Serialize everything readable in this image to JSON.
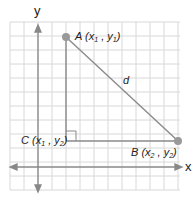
{
  "diagram": {
    "axes": {
      "x_label": "x",
      "y_label": "y"
    },
    "points": {
      "A": {
        "name": "A",
        "coord_x": "x",
        "coord_x_sub": "1",
        "coord_y": "y",
        "coord_y_sub": "1"
      },
      "B": {
        "name": "B",
        "coord_x": "x",
        "coord_x_sub": "2",
        "coord_y": "y",
        "coord_y_sub": "2"
      },
      "C": {
        "name": "C",
        "coord_x": "x",
        "coord_x_sub": "1",
        "coord_y": "y",
        "coord_y_sub": "2"
      }
    },
    "segment_label": "d",
    "colors": {
      "grid": "#d8d8d8",
      "axis": "#888888",
      "segment": "#8a8a8a",
      "point": "#999999",
      "text": "#222222"
    }
  }
}
